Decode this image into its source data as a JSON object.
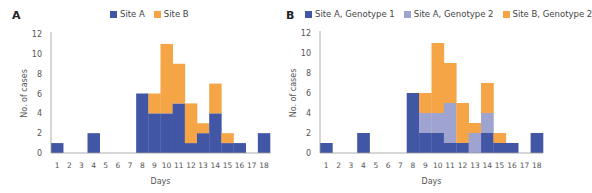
{
  "colors": {
    "site_a": "#4256a6",
    "site_a_g2": "#9ea3d0",
    "site_b": "#f5a545",
    "axis": "#9a9a9a"
  },
  "panels": [
    {
      "label": "A",
      "legend": [
        "Site A",
        "Site B"
      ]
    },
    {
      "label": "B",
      "legend": [
        "Site A, Genotype 1",
        "Site A, Genotype 2",
        "Site B, Genotype 2"
      ]
    }
  ],
  "chart_data": [
    {
      "type": "bar",
      "stacked": true,
      "panel": "A",
      "title": "",
      "xlabel": "Days",
      "ylabel": "No. of cases",
      "ylim": [
        0,
        12
      ],
      "yticks": [
        0,
        2,
        4,
        6,
        8,
        10,
        12
      ],
      "grid": false,
      "legend_position": "top",
      "categories": [
        "1",
        "2",
        "3",
        "4",
        "5",
        "6",
        "7",
        "8",
        "9",
        "10",
        "11",
        "12",
        "13",
        "14",
        "15",
        "16",
        "17",
        "18"
      ],
      "series": [
        {
          "name": "Site A",
          "color": "#4256a6",
          "values": [
            1,
            0,
            0,
            2,
            0,
            0,
            0,
            6,
            4,
            4,
            5,
            1,
            2,
            4,
            1,
            1,
            0,
            2
          ]
        },
        {
          "name": "Site B",
          "color": "#f5a545",
          "values": [
            0,
            0,
            0,
            0,
            0,
            0,
            0,
            0,
            2,
            7,
            4,
            4,
            1,
            3,
            1,
            0,
            0,
            0
          ]
        }
      ]
    },
    {
      "type": "bar",
      "stacked": true,
      "panel": "B",
      "title": "",
      "xlabel": "Days",
      "ylabel": "No. of cases",
      "ylim": [
        0,
        12
      ],
      "yticks": [
        0,
        2,
        4,
        6,
        8,
        10,
        12
      ],
      "grid": false,
      "legend_position": "top",
      "categories": [
        "1",
        "2",
        "3",
        "4",
        "5",
        "6",
        "7",
        "8",
        "9",
        "10",
        "11",
        "12",
        "13",
        "14",
        "15",
        "16",
        "17",
        "18"
      ],
      "series": [
        {
          "name": "Site A, Genotype 1",
          "color": "#4256a6",
          "values": [
            1,
            0,
            0,
            2,
            0,
            0,
            0,
            6,
            2,
            2,
            1,
            1,
            0,
            2,
            1,
            1,
            0,
            2
          ]
        },
        {
          "name": "Site A, Genotype 2",
          "color": "#9ea3d0",
          "values": [
            0,
            0,
            0,
            0,
            0,
            0,
            0,
            0,
            2,
            2,
            4,
            0,
            2,
            2,
            0,
            0,
            0,
            0
          ]
        },
        {
          "name": "Site B, Genotype 2",
          "color": "#f5a545",
          "values": [
            0,
            0,
            0,
            0,
            0,
            0,
            0,
            0,
            2,
            7,
            4,
            4,
            1,
            3,
            1,
            0,
            0,
            0
          ]
        }
      ]
    }
  ]
}
